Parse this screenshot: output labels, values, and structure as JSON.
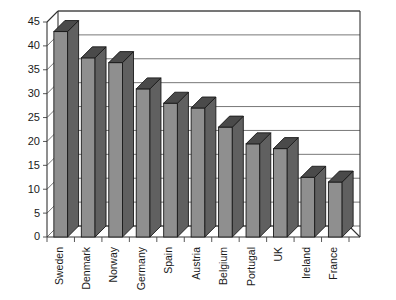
{
  "chart_data": {
    "type": "bar",
    "title": "",
    "subtitle": "",
    "xlabel": "",
    "ylabel": "",
    "categories": [
      "Sweden",
      "Denmark",
      "Norway",
      "Germany",
      "Spain",
      "Austria",
      "Belgium",
      "Portugal",
      "UK",
      "Ireland",
      "France"
    ],
    "values": [
      43,
      37.5,
      36.5,
      31,
      28,
      27,
      23,
      19.5,
      18.5,
      12.5,
      11.5
    ],
    "ylim": [
      0,
      45
    ],
    "ytick_step": 5,
    "ytick_labels": [
      "0",
      "5",
      "10",
      "15",
      "20",
      "25",
      "30",
      "35",
      "40",
      "45"
    ],
    "grid": true,
    "legend": false,
    "legend_position": "none",
    "style": "3d-column",
    "colors": {
      "bar_front": "#8f8f8f",
      "bar_side": "#606060",
      "bar_top": "#4a4a4a",
      "bar_outline": "#1a1a1a",
      "gridline": "#555555",
      "axis": "#333333",
      "background": "#ffffff",
      "text": "#1a1a1a"
    }
  }
}
